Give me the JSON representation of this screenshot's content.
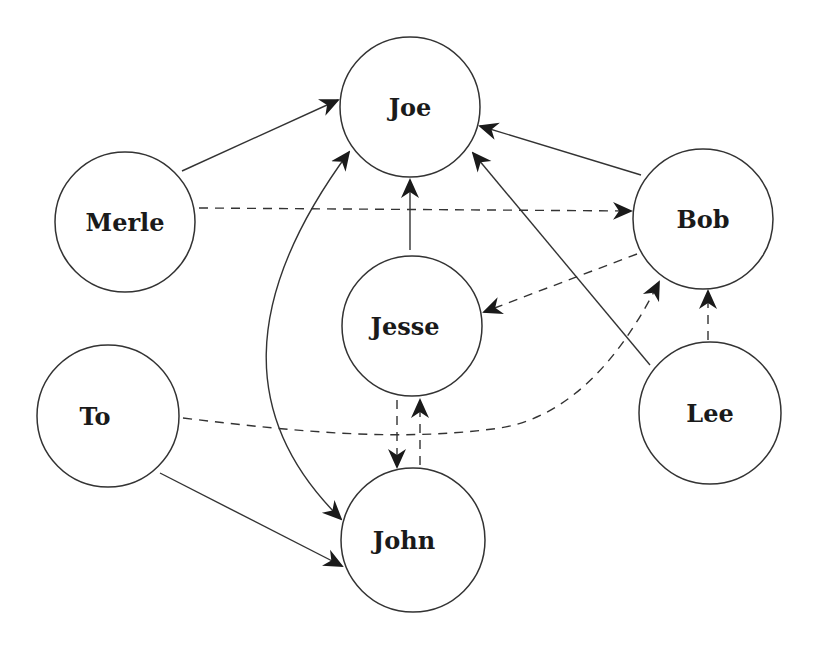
{
  "diagram": {
    "type": "directed-graph",
    "colors": {
      "stroke": "#333333",
      "text": "#1a1a1a",
      "background": "#ffffff"
    },
    "nodes": [
      {
        "id": "joe",
        "label": "Joe",
        "cx": 410,
        "cy": 107,
        "r": 70
      },
      {
        "id": "merle",
        "label": "Merle",
        "cx": 125,
        "cy": 222,
        "r": 70
      },
      {
        "id": "bob",
        "label": "Bob",
        "cx": 703,
        "cy": 219,
        "r": 70
      },
      {
        "id": "jesse",
        "label": "Jesse",
        "cx": 412,
        "cy": 326,
        "r": 70
      },
      {
        "id": "to",
        "label": "To",
        "cx": 108,
        "cy": 416,
        "r": 71
      },
      {
        "id": "lee",
        "label": "Lee",
        "cx": 710,
        "cy": 413,
        "r": 71
      },
      {
        "id": "john",
        "label": "John",
        "cx": 413,
        "cy": 540,
        "r": 72
      }
    ],
    "edges": [
      {
        "from": "Merle",
        "to": "Joe",
        "style": "solid"
      },
      {
        "from": "Bob",
        "to": "Joe",
        "style": "solid"
      },
      {
        "from": "Lee",
        "to": "Joe",
        "style": "solid"
      },
      {
        "from": "Jesse",
        "to": "Joe",
        "style": "solid"
      },
      {
        "from": "Joe",
        "to": "John",
        "style": "solid",
        "bidirectional": true,
        "curved": true
      },
      {
        "from": "To",
        "to": "John",
        "style": "solid"
      },
      {
        "from": "Merle",
        "to": "Bob",
        "style": "dashed"
      },
      {
        "from": "Bob",
        "to": "Jesse",
        "style": "dashed"
      },
      {
        "from": "To",
        "to": "Bob",
        "style": "dashed",
        "curved": true
      },
      {
        "from": "Lee",
        "to": "Bob",
        "style": "dashed"
      },
      {
        "from": "Jesse",
        "to": "John",
        "style": "dashed"
      },
      {
        "from": "John",
        "to": "Jesse",
        "style": "dashed"
      }
    ]
  }
}
